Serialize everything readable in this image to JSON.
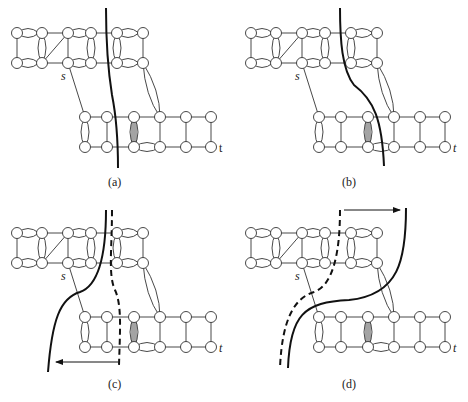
{
  "figure": {
    "panels": [
      {
        "id": "a",
        "caption": "(a)",
        "source_label": "s",
        "sink_label": "t",
        "cut": "solid cut crossing middle"
      },
      {
        "id": "b",
        "caption": "(b)",
        "source_label": "s",
        "sink_label": "t",
        "cut": "solid cut curving right"
      },
      {
        "id": "c",
        "caption": "(c)",
        "source_label": "s",
        "sink_label": "t",
        "cut": "solid and dashed cuts, arrow pointing left"
      },
      {
        "id": "d",
        "caption": "(d)",
        "source_label": "s",
        "sink_label": "t",
        "cut": "dashed and solid cuts, arrow pointing right"
      }
    ]
  }
}
